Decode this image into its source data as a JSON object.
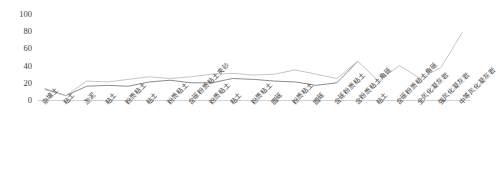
{
  "chart_data": {
    "type": "line",
    "title": "",
    "subtitle": "",
    "xlabel": "",
    "ylabel": "",
    "ylim": [
      0,
      100
    ],
    "yticks": [
      0,
      20,
      40,
      60,
      80,
      100
    ],
    "grid": false,
    "legend": "none",
    "categories": [
      "杂填土",
      "粘土",
      "淤泥",
      "粘土",
      "粉质粘土",
      "粘土",
      "粉质粘土",
      "含砾粉质粘土夹砂",
      "粉质粘土",
      "粘土",
      "粉质粘土",
      "圆砾",
      "粉质粘土",
      "圆砾",
      "含砾粉质粘土",
      "含粉质粘土角砾",
      "粘土",
      "含砾粉质粘土角砾",
      "全风化凝灰岩",
      "强风化凝灰岩",
      "中等风化凝灰岩"
    ],
    "series": [
      {
        "name": "series-1",
        "color": "#7f7f7f",
        "values": [
          13,
          5,
          16,
          17,
          16,
          21,
          23,
          20,
          20,
          25,
          24,
          22,
          21,
          17,
          20,
          45,
          null,
          null,
          null,
          null,
          null
        ]
      },
      {
        "name": "series-2",
        "color": "#bfbfbf",
        "values": [
          12,
          5,
          22,
          21,
          24,
          27,
          25,
          27,
          30,
          31,
          29,
          30,
          35,
          30,
          25,
          45,
          22,
          40,
          25,
          38,
          78
        ]
      }
    ]
  },
  "axes": {
    "y_tick_labels": [
      "100",
      "80",
      "60",
      "40",
      "20",
      "0"
    ]
  }
}
